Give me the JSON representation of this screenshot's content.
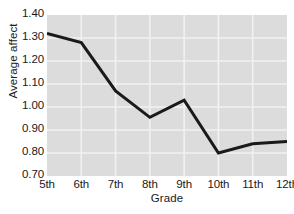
{
  "chart_data": {
    "type": "line",
    "title": "",
    "xlabel": "Grade",
    "ylabel": "Average affect",
    "categories": [
      "5th",
      "6th",
      "7th",
      "8th",
      "9th",
      "10th",
      "11th",
      "12th"
    ],
    "values": [
      1.32,
      1.28,
      1.07,
      0.955,
      1.03,
      0.8,
      0.84,
      0.85
    ],
    "series": [
      {
        "name": "Average affect",
        "values": [
          1.32,
          1.28,
          1.07,
          0.955,
          1.03,
          0.8,
          0.84,
          0.85
        ]
      }
    ],
    "ylim": [
      0.7,
      1.4
    ],
    "yticks": [
      1.4,
      1.3,
      1.2,
      1.1,
      1.0,
      0.9,
      0.8,
      0.7
    ],
    "ytick_labels": [
      "1.40",
      "1.30",
      "1.20",
      "1.10",
      "1.00",
      "0.90",
      "0.80",
      "0.70"
    ],
    "grid": true,
    "grid_color": "#f2f2f2",
    "plot_background": "#dcdcdc",
    "line_color": "#1a1a1a",
    "line_width": 3,
    "legend": null,
    "legend_position": "none"
  }
}
